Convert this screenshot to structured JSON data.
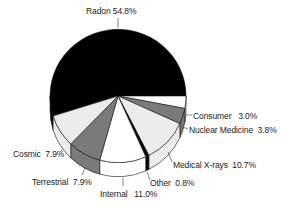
{
  "chart_data": {
    "type": "pie",
    "style": "3d-tilted",
    "title": "",
    "categories": [
      "Radon",
      "Consumer",
      "Nuclear Medicine",
      "Medical X-rays",
      "Other",
      "Internal",
      "Terrestrial",
      "Cosmic"
    ],
    "values": [
      54.8,
      3.0,
      3.8,
      10.7,
      0.8,
      11.0,
      7.9,
      7.9
    ],
    "labels": [
      {
        "name": "Radon",
        "pct": "54.8%"
      },
      {
        "name": "Consumer",
        "pct": "3.0%"
      },
      {
        "name": "Nuclear Medicine",
        "pct": "3.8%"
      },
      {
        "name": "Medical X-rays",
        "pct": "10.7%"
      },
      {
        "name": "Other",
        "pct": "0.8%"
      },
      {
        "name": "Internal",
        "pct": "11.0%"
      },
      {
        "name": "Terrestrial",
        "pct": "7.9%"
      },
      {
        "name": "Cosmic",
        "pct": "7.9%"
      }
    ],
    "colors": {
      "Radon": "#000000",
      "Consumer": "#ffffff",
      "Nuclear Medicine": "#7a7a7a",
      "Medical X-rays": "#ececec",
      "Other": "#000000",
      "Internal": "#ffffff",
      "Terrestrial": "#7a7a7a",
      "Cosmic": "#ececec"
    },
    "legend": "none (callout labels)"
  }
}
